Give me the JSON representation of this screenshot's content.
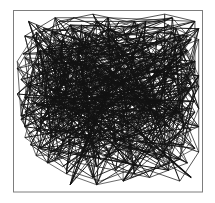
{
  "figure": {
    "title": "",
    "caption": "",
    "type": "random-walk-trajectory",
    "background_color": "#ffffff",
    "frame_color": "#7d7d7d",
    "line_color": "#121212"
  },
  "chart_data": {
    "type": "line",
    "title": "",
    "xlabel": "",
    "ylabel": "",
    "xlim": [
      0,
      100
    ],
    "ylim": [
      0,
      100
    ],
    "grid": false,
    "legend": null,
    "tick_labels": {
      "x": [],
      "y": []
    },
    "annotations": [],
    "series": [
      {
        "name": "walk-1",
        "points": [
          [
            8,
            94
          ],
          [
            22,
            88
          ],
          [
            5,
            76
          ],
          [
            30,
            92
          ],
          [
            44,
            70
          ],
          [
            18,
            62
          ],
          [
            39,
            55
          ],
          [
            12,
            48
          ],
          [
            33,
            36
          ],
          [
            9,
            26
          ],
          [
            26,
            14
          ],
          [
            47,
            30
          ],
          [
            58,
            52
          ],
          [
            36,
            66
          ],
          [
            52,
            80
          ],
          [
            70,
            94
          ],
          [
            62,
            72
          ],
          [
            80,
            84
          ],
          [
            92,
            70
          ],
          [
            74,
            58
          ],
          [
            88,
            44
          ],
          [
            66,
            38
          ],
          [
            84,
            24
          ],
          [
            60,
            16
          ],
          [
            42,
            8
          ],
          [
            24,
            20
          ],
          [
            14,
            38
          ],
          [
            30,
            50
          ],
          [
            16,
            68
          ],
          [
            34,
            78
          ],
          [
            50,
            90
          ],
          [
            68,
            78
          ],
          [
            86,
            90
          ],
          [
            96,
            66
          ],
          [
            78,
            50
          ],
          [
            94,
            34
          ],
          [
            72,
            22
          ],
          [
            52,
            34
          ],
          [
            38,
            44
          ],
          [
            20,
            56
          ],
          [
            6,
            44
          ],
          [
            28,
            30
          ],
          [
            46,
            18
          ],
          [
            64,
            10
          ],
          [
            82,
            16
          ],
          [
            90,
            38
          ],
          [
            76,
            64
          ],
          [
            56,
            60
          ],
          [
            40,
            82
          ],
          [
            22,
            72
          ],
          [
            10,
            86
          ],
          [
            32,
            96
          ],
          [
            54,
            88
          ],
          [
            74,
            72
          ],
          [
            92,
            86
          ],
          [
            84,
            60
          ],
          [
            70,
            46
          ],
          [
            50,
            54
          ],
          [
            34,
            62
          ],
          [
            18,
            80
          ],
          [
            4,
            62
          ],
          [
            20,
            44
          ],
          [
            42,
            40
          ],
          [
            60,
            30
          ],
          [
            78,
            36
          ],
          [
            96,
            50
          ],
          [
            80,
            70
          ],
          [
            62,
            84
          ],
          [
            44,
            94
          ],
          [
            26,
            84
          ],
          [
            12,
            70
          ],
          [
            28,
            58
          ],
          [
            46,
            64
          ],
          [
            66,
            56
          ],
          [
            86,
            74
          ],
          [
            98,
            90
          ],
          [
            88,
            54
          ],
          [
            72,
            40
          ],
          [
            54,
            28
          ],
          [
            36,
            22
          ],
          [
            18,
            16
          ],
          [
            8,
            32
          ],
          [
            24,
            46
          ],
          [
            44,
            52
          ],
          [
            64,
            66
          ],
          [
            82,
            82
          ],
          [
            94,
            60
          ],
          [
            76,
            44
          ],
          [
            58,
            42
          ],
          [
            40,
            30
          ],
          [
            22,
            34
          ],
          [
            6,
            52
          ],
          [
            16,
            90
          ],
          [
            38,
            88
          ],
          [
            56,
            76
          ],
          [
            76,
            88
          ],
          [
            90,
            76
          ],
          [
            72,
            62
          ],
          [
            52,
            70
          ],
          [
            30,
            68
          ]
        ]
      },
      {
        "name": "walk-2",
        "points": [
          [
            50,
            96
          ],
          [
            64,
            82
          ],
          [
            46,
            76
          ],
          [
            70,
            66
          ],
          [
            52,
            58
          ],
          [
            74,
            48
          ],
          [
            56,
            40
          ],
          [
            78,
            30
          ],
          [
            60,
            22
          ],
          [
            82,
            12
          ],
          [
            94,
            28
          ],
          [
            86,
            48
          ],
          [
            96,
            68
          ],
          [
            84,
            88
          ],
          [
            66,
            92
          ],
          [
            48,
            84
          ],
          [
            32,
            90
          ],
          [
            16,
            78
          ],
          [
            26,
            60
          ],
          [
            10,
            50
          ],
          [
            24,
            38
          ],
          [
            40,
            28
          ],
          [
            28,
            12
          ],
          [
            46,
            6
          ],
          [
            66,
            14
          ],
          [
            88,
            6
          ],
          [
            98,
            22
          ],
          [
            90,
            42
          ],
          [
            98,
            58
          ],
          [
            88,
            72
          ],
          [
            98,
            84
          ],
          [
            78,
            94
          ],
          [
            58,
            90
          ],
          [
            38,
            80
          ],
          [
            20,
            88
          ],
          [
            6,
            74
          ],
          [
            18,
            58
          ],
          [
            4,
            40
          ],
          [
            14,
            24
          ],
          [
            34,
            16
          ],
          [
            54,
            12
          ],
          [
            72,
            8
          ],
          [
            92,
            16
          ],
          [
            84,
            34
          ],
          [
            96,
            44
          ],
          [
            86,
            62
          ],
          [
            70,
            76
          ],
          [
            54,
            66
          ],
          [
            38,
            58
          ],
          [
            22,
            50
          ],
          [
            8,
            60
          ],
          [
            20,
            70
          ],
          [
            36,
            72
          ],
          [
            50,
            48
          ],
          [
            66,
            34
          ],
          [
            80,
            20
          ],
          [
            94,
            8
          ],
          [
            76,
            18
          ],
          [
            62,
            44
          ],
          [
            44,
            46
          ],
          [
            30,
            42
          ],
          [
            12,
            34
          ],
          [
            2,
            54
          ],
          [
            14,
            66
          ],
          [
            32,
            82
          ],
          [
            50,
            80
          ],
          [
            68,
            70
          ],
          [
            88,
            80
          ],
          [
            96,
            94
          ],
          [
            80,
            98
          ],
          [
            60,
            94
          ],
          [
            42,
            98
          ],
          [
            24,
            94
          ],
          [
            10,
            82
          ],
          [
            2,
            68
          ],
          [
            16,
            46
          ],
          [
            30,
            26
          ],
          [
            48,
            20
          ],
          [
            64,
            26
          ],
          [
            78,
            42
          ],
          [
            92,
            56
          ],
          [
            74,
            70
          ],
          [
            58,
            62
          ],
          [
            42,
            66
          ],
          [
            26,
            74
          ],
          [
            12,
            92
          ],
          [
            34,
            58
          ],
          [
            52,
            50
          ],
          [
            70,
            54
          ],
          [
            86,
            40
          ],
          [
            98,
            36
          ],
          [
            80,
            28
          ],
          [
            62,
            18
          ],
          [
            46,
            32
          ],
          [
            28,
            48
          ],
          [
            14,
            54
          ],
          [
            6,
            86
          ],
          [
            22,
            96
          ],
          [
            40,
            86
          ],
          [
            56,
            72
          ]
        ]
      },
      {
        "name": "walk-3",
        "points": [
          [
            30,
            4
          ],
          [
            44,
            24
          ],
          [
            58,
            6
          ],
          [
            72,
            32
          ],
          [
            88,
            18
          ],
          [
            94,
            46
          ],
          [
            80,
            58
          ],
          [
            92,
            78
          ],
          [
            74,
            86
          ],
          [
            56,
            94
          ],
          [
            40,
            74
          ],
          [
            24,
            84
          ],
          [
            10,
            66
          ],
          [
            22,
            52
          ],
          [
            6,
            36
          ],
          [
            20,
            22
          ],
          [
            38,
            34
          ],
          [
            52,
            20
          ],
          [
            68,
            46
          ],
          [
            84,
            52
          ],
          [
            96,
            72
          ],
          [
            82,
            92
          ],
          [
            64,
            76
          ],
          [
            48,
            62
          ],
          [
            34,
            44
          ],
          [
            18,
            32
          ],
          [
            4,
            48
          ],
          [
            16,
            72
          ],
          [
            32,
            86
          ],
          [
            46,
            70
          ],
          [
            62,
            58
          ],
          [
            76,
            34
          ],
          [
            90,
            26
          ],
          [
            98,
            46
          ],
          [
            86,
            66
          ],
          [
            70,
            82
          ],
          [
            54,
            78
          ],
          [
            36,
            92
          ],
          [
            20,
            78
          ],
          [
            8,
            58
          ],
          [
            26,
            40
          ],
          [
            42,
            50
          ],
          [
            58,
            36
          ],
          [
            74,
            24
          ],
          [
            90,
            34
          ],
          [
            96,
            58
          ],
          [
            82,
            74
          ],
          [
            66,
            64
          ],
          [
            50,
            44
          ],
          [
            34,
            30
          ],
          [
            16,
            40
          ],
          [
            2,
            72
          ],
          [
            12,
            88
          ],
          [
            28,
            70
          ],
          [
            44,
            58
          ],
          [
            60,
            68
          ],
          [
            78,
            60
          ],
          [
            94,
            84
          ],
          [
            84,
            96
          ],
          [
            68,
            88
          ],
          [
            52,
            86
          ],
          [
            38,
            68
          ],
          [
            24,
            62
          ],
          [
            10,
            44
          ],
          [
            26,
            28
          ],
          [
            44,
            14
          ],
          [
            60,
            30
          ],
          [
            76,
            50
          ],
          [
            92,
            64
          ],
          [
            80,
            80
          ],
          [
            64,
            94
          ],
          [
            46,
            88
          ],
          [
            30,
            76
          ],
          [
            14,
            60
          ],
          [
            6,
            30
          ],
          [
            22,
            18
          ],
          [
            40,
            40
          ],
          [
            56,
            52
          ],
          [
            72,
            68
          ],
          [
            88,
            86
          ],
          [
            98,
            64
          ],
          [
            86,
            44
          ],
          [
            70,
            38
          ],
          [
            54,
            26
          ],
          [
            38,
            18
          ],
          [
            20,
            30
          ],
          [
            8,
            46
          ],
          [
            18,
            66
          ],
          [
            34,
            80
          ],
          [
            50,
            60
          ],
          [
            66,
            50
          ],
          [
            82,
            36
          ],
          [
            96,
            24
          ],
          [
            78,
            14
          ],
          [
            62,
            8
          ],
          [
            44,
            4
          ],
          [
            28,
            10
          ],
          [
            12,
            20
          ],
          [
            4,
            42
          ],
          [
            14,
            78
          ]
        ]
      }
    ]
  }
}
